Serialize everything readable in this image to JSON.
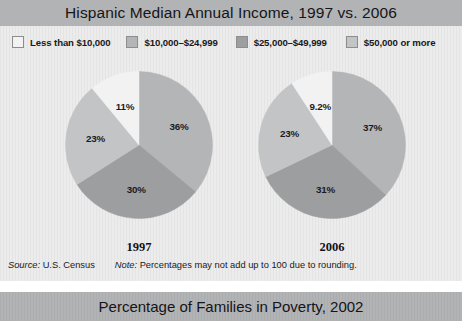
{
  "figure": {
    "title": "Hispanic Median Annual Income, 1997 vs. 2006",
    "legend": [
      {
        "label": "Less than $10,000",
        "color": "#f2f2f2"
      },
      {
        "label": "$10,000–$24,999",
        "color": "#b4b5b6"
      },
      {
        "label": "$25,000–$49,999",
        "color": "#9d9e9f"
      },
      {
        "label": "$50,000 or more",
        "color": "#c3c4c5"
      }
    ],
    "source_label": "Source:",
    "source_value": "U.S. Census",
    "note_label": "Note:",
    "note_value": "Percentages may not add up to 100 due to rounding.",
    "caption_1997": "1997",
    "caption_2006": "2006"
  },
  "bottom_band": {
    "title": "Percentage of Families in Poverty, 2002"
  },
  "chart_data": [
    {
      "type": "pie",
      "title": "1997",
      "labels": [
        "$10,000–$24,999",
        "$25,000–$49,999",
        "$50,000 or more",
        "Less than $10,000"
      ],
      "values": [
        36,
        30,
        23,
        11
      ],
      "display_values": [
        "36%",
        "30%",
        "23%",
        "11%"
      ],
      "colors": [
        "#b4b5b6",
        "#9d9e9f",
        "#c3c4c5",
        "#f2f2f2"
      ],
      "start_angle_deg": 0,
      "direction": "clockwise",
      "legend_position": "top"
    },
    {
      "type": "pie",
      "title": "2006",
      "labels": [
        "$10,000–$24,999",
        "$25,000–$49,999",
        "$50,000 or more",
        "Less than $10,000"
      ],
      "values": [
        37,
        31,
        23,
        9.2
      ],
      "display_values": [
        "37%",
        "31%",
        "23%",
        "9.2%"
      ],
      "colors": [
        "#b4b5b6",
        "#9d9e9f",
        "#c3c4c5",
        "#f2f2f2"
      ],
      "start_angle_deg": 0,
      "direction": "clockwise",
      "legend_position": "top"
    }
  ]
}
